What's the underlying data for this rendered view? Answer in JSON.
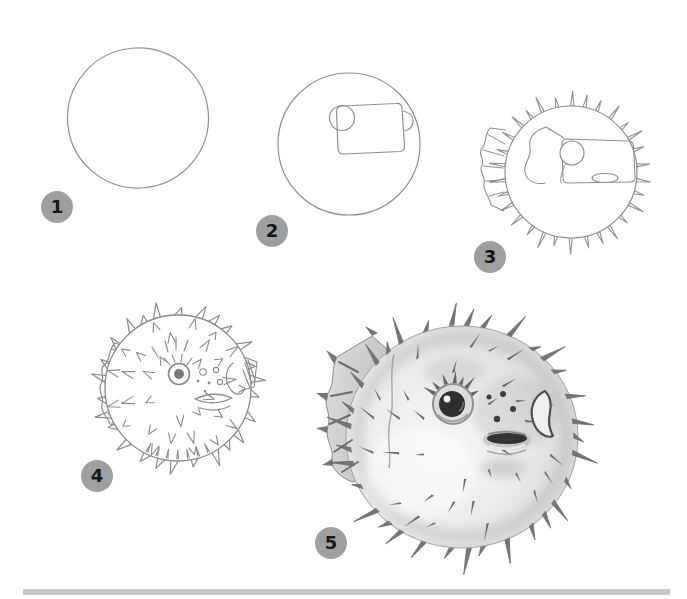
{
  "tutorial": {
    "subject": "pufferfish-step-by-step-drawing",
    "steps": [
      {
        "number": "1",
        "illustration": "outline-circle"
      },
      {
        "number": "2",
        "illustration": "circle-with-snout-box-and-eye-guide"
      },
      {
        "number": "3",
        "illustration": "outlined-body-with-spikes-tail-fin-eye-and-mouth"
      },
      {
        "number": "4",
        "illustration": "detailed-line-sketch-with-spots-spikes-and-fins"
      },
      {
        "number": "5",
        "illustration": "final-shaded-pufferfish-drawing"
      }
    ],
    "badge": {
      "background": "#9f9f9f",
      "number_color": "#161616"
    }
  },
  "canvas": {
    "background_color": "#ffffff",
    "pencil_color": "#8f8f8f"
  },
  "footer": {
    "bar_color": "#c9c9c9"
  }
}
